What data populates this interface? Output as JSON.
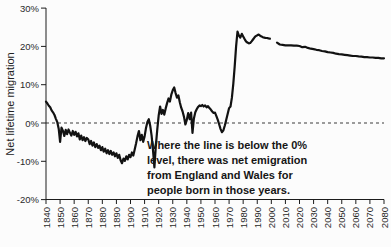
{
  "chart_data": {
    "type": "line",
    "title": "",
    "xlabel": "",
    "ylabel": "Net lifetime migration",
    "xlim": [
      1840,
      2080
    ],
    "ylim": [
      -20,
      30
    ],
    "grid": false,
    "zero_reference_line": {
      "value": 0,
      "style": "dashed"
    },
    "x_ticks": [
      1840,
      1850,
      1860,
      1870,
      1880,
      1890,
      1900,
      1910,
      1920,
      1930,
      1940,
      1950,
      1960,
      1970,
      1980,
      1990,
      2000,
      2010,
      2020,
      2030,
      2040,
      2050,
      2060,
      2070,
      2080
    ],
    "y_ticks": [
      {
        "label": "30%",
        "value": 30
      },
      {
        "label": "20%",
        "value": 20
      },
      {
        "label": "10%",
        "value": 10
      },
      {
        "label": "0%",
        "value": 0
      },
      {
        "label": "-10%",
        "value": -10
      },
      {
        "label": "-20%",
        "value": -20
      }
    ],
    "line_color": "#121212",
    "series": [
      {
        "name": "historical",
        "points": [
          [
            1840,
            5.6
          ],
          [
            1841,
            5.1
          ],
          [
            1842,
            4.5
          ],
          [
            1843,
            4.1
          ],
          [
            1844,
            3.3
          ],
          [
            1845,
            2.8
          ],
          [
            1846,
            2.1
          ],
          [
            1847,
            1.1
          ],
          [
            1848,
            0.2
          ],
          [
            1849,
            -1.5
          ],
          [
            1850,
            -4.9
          ],
          [
            1851,
            -1.2
          ],
          [
            1852,
            -2.0
          ],
          [
            1853,
            -3.4
          ],
          [
            1854,
            -1.8
          ],
          [
            1855,
            -2.9
          ],
          [
            1856,
            -1.7
          ],
          [
            1857,
            -2.5
          ],
          [
            1858,
            -3.3
          ],
          [
            1859,
            -2.1
          ],
          [
            1860,
            -3.1
          ],
          [
            1861,
            -2.3
          ],
          [
            1862,
            -3.5
          ],
          [
            1863,
            -2.7
          ],
          [
            1864,
            -4.3
          ],
          [
            1865,
            -3.3
          ],
          [
            1866,
            -4.5
          ],
          [
            1867,
            -3.7
          ],
          [
            1868,
            -4.7
          ],
          [
            1869,
            -3.9
          ],
          [
            1870,
            -4.3
          ],
          [
            1871,
            -5.5
          ],
          [
            1872,
            -4.7
          ],
          [
            1873,
            -5.9
          ],
          [
            1874,
            -5.1
          ],
          [
            1875,
            -6.3
          ],
          [
            1876,
            -5.5
          ],
          [
            1877,
            -6.5
          ],
          [
            1878,
            -5.9
          ],
          [
            1879,
            -7.1
          ],
          [
            1880,
            -6.3
          ],
          [
            1881,
            -7.5
          ],
          [
            1882,
            -6.7
          ],
          [
            1883,
            -7.9
          ],
          [
            1884,
            -7.1
          ],
          [
            1885,
            -8.1
          ],
          [
            1886,
            -7.3
          ],
          [
            1887,
            -8.3
          ],
          [
            1888,
            -7.7
          ],
          [
            1889,
            -8.7
          ],
          [
            1890,
            -7.9
          ],
          [
            1891,
            -9.1
          ],
          [
            1892,
            -8.3
          ],
          [
            1893,
            -9.7
          ],
          [
            1894,
            -10.5
          ],
          [
            1895,
            -9.3
          ],
          [
            1896,
            -9.9
          ],
          [
            1897,
            -8.7
          ],
          [
            1898,
            -9.5
          ],
          [
            1899,
            -8.3
          ],
          [
            1900,
            -8.9
          ],
          [
            1901,
            -7.7
          ],
          [
            1902,
            -8.5
          ],
          [
            1903,
            -6.9
          ],
          [
            1904,
            -5.3
          ],
          [
            1905,
            -3.5
          ],
          [
            1906,
            -2.1
          ],
          [
            1907,
            -4.5
          ],
          [
            1908,
            -3.1
          ],
          [
            1909,
            -4.9
          ],
          [
            1910,
            -3.5
          ],
          [
            1911,
            -1.3
          ],
          [
            1912,
            0.3
          ],
          [
            1913,
            1.0
          ],
          [
            1914,
            -0.7
          ],
          [
            1915,
            -3.3
          ],
          [
            1916,
            -7.1
          ],
          [
            1917,
            -11.6
          ],
          [
            1918,
            -6.1
          ],
          [
            1919,
            -1.6
          ],
          [
            1920,
            2.0
          ],
          [
            1921,
            4.3
          ],
          [
            1922,
            2.4
          ],
          [
            1923,
            3.4
          ],
          [
            1924,
            2.2
          ],
          [
            1925,
            3.8
          ],
          [
            1926,
            5.2
          ],
          [
            1927,
            6.4
          ],
          [
            1928,
            5.6
          ],
          [
            1929,
            7.4
          ],
          [
            1930,
            8.6
          ],
          [
            1931,
            9.3
          ],
          [
            1932,
            7.8
          ],
          [
            1933,
            6.6
          ],
          [
            1934,
            7.2
          ],
          [
            1935,
            5.4
          ],
          [
            1936,
            4.0
          ],
          [
            1937,
            3.0
          ],
          [
            1938,
            1.6
          ],
          [
            1939,
            -0.4
          ],
          [
            1940,
            0.8
          ],
          [
            1941,
            2.6
          ],
          [
            1942,
            1.0
          ],
          [
            1943,
            2.7
          ],
          [
            1944,
            -2.6
          ],
          [
            1945,
            1.2
          ],
          [
            1946,
            2.8
          ],
          [
            1947,
            3.6
          ],
          [
            1948,
            4.2
          ],
          [
            1949,
            4.6
          ],
          [
            1950,
            4.4
          ],
          [
            1951,
            4.7
          ],
          [
            1952,
            4.3
          ],
          [
            1953,
            4.6
          ],
          [
            1954,
            4.1
          ],
          [
            1955,
            4.4
          ],
          [
            1956,
            3.9
          ],
          [
            1957,
            3.5
          ],
          [
            1958,
            3.0
          ],
          [
            1959,
            2.6
          ],
          [
            1960,
            2.7
          ],
          [
            1961,
            1.8
          ],
          [
            1962,
            0.8
          ],
          [
            1963,
            -0.4
          ],
          [
            1964,
            -1.6
          ],
          [
            1965,
            -2.4
          ],
          [
            1966,
            -1.9
          ],
          [
            1967,
            -0.6
          ],
          [
            1968,
            0.9
          ],
          [
            1969,
            2.4
          ],
          [
            1970,
            3.9
          ],
          [
            1971,
            4.3
          ],
          [
            1972,
            6.6
          ],
          [
            1973,
            10.2
          ],
          [
            1974,
            14.8
          ],
          [
            1975,
            20.0
          ],
          [
            1976,
            23.9
          ],
          [
            1977,
            22.8
          ],
          [
            1978,
            22.3
          ],
          [
            1979,
            23.3
          ],
          [
            1980,
            22.6
          ],
          [
            1981,
            21.9
          ],
          [
            1982,
            21.3
          ],
          [
            1983,
            21.0
          ],
          [
            1984,
            20.8
          ],
          [
            1985,
            20.9
          ],
          [
            1986,
            21.3
          ],
          [
            1987,
            21.8
          ],
          [
            1988,
            22.3
          ],
          [
            1989,
            22.7
          ],
          [
            1990,
            22.9
          ],
          [
            1991,
            23.1
          ],
          [
            1992,
            22.8
          ],
          [
            1993,
            22.6
          ],
          [
            1994,
            22.4
          ],
          [
            1995,
            22.3
          ],
          [
            1996,
            22.2
          ],
          [
            1997,
            22.2
          ],
          [
            1998,
            22.1
          ],
          [
            1999,
            22.0
          ]
        ]
      },
      {
        "name": "projection",
        "points": [
          [
            2004,
            21.0
          ],
          [
            2006,
            20.5
          ],
          [
            2008,
            20.4
          ],
          [
            2010,
            20.3
          ],
          [
            2012,
            20.3
          ],
          [
            2014,
            20.3
          ],
          [
            2016,
            20.2
          ],
          [
            2018,
            20.2
          ],
          [
            2020,
            20.1
          ],
          [
            2022,
            19.8
          ],
          [
            2024,
            19.9
          ],
          [
            2026,
            19.6
          ],
          [
            2028,
            19.4
          ],
          [
            2030,
            19.3
          ],
          [
            2032,
            19.1
          ],
          [
            2034,
            19.0
          ],
          [
            2036,
            18.8
          ],
          [
            2038,
            18.7
          ],
          [
            2040,
            18.5
          ],
          [
            2042,
            18.4
          ],
          [
            2044,
            18.3
          ],
          [
            2046,
            18.1
          ],
          [
            2048,
            18.0
          ],
          [
            2050,
            17.9
          ],
          [
            2052,
            17.8
          ],
          [
            2054,
            17.7
          ],
          [
            2056,
            17.6
          ],
          [
            2058,
            17.5
          ],
          [
            2060,
            17.5
          ],
          [
            2062,
            17.4
          ],
          [
            2064,
            17.3
          ],
          [
            2066,
            17.2
          ],
          [
            2068,
            17.2
          ],
          [
            2070,
            17.1
          ],
          [
            2072,
            17.1
          ],
          [
            2074,
            17.0
          ],
          [
            2076,
            17.0
          ],
          [
            2078,
            16.9
          ],
          [
            2080,
            16.9
          ]
        ]
      }
    ]
  },
  "annotation": {
    "lines": [
      "Where the line is below the 0%",
      "level, there was net emigration",
      "from England and Wales for",
      "people born in those years."
    ]
  }
}
